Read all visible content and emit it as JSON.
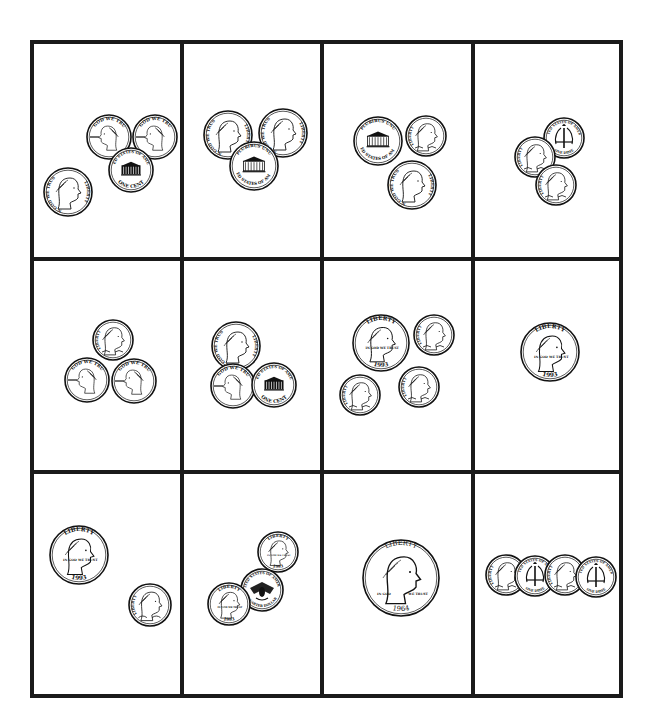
{
  "worksheet": {
    "title": "",
    "grid": {
      "rows": 3,
      "cols": 4,
      "border_color": "#1a1a1a",
      "left": 32,
      "top": 42,
      "right": 621,
      "bottom": 696,
      "v_lines": [
        182,
        322,
        473
      ],
      "h_lines": [
        259,
        472
      ],
      "line_width": 4
    },
    "cells": [
      {
        "id": 1,
        "coins": [
          {
            "type": "penny",
            "side": "front",
            "x": 109,
            "y": 137,
            "r": 22
          },
          {
            "type": "penny",
            "side": "front",
            "x": 155,
            "y": 137,
            "r": 22
          },
          {
            "type": "penny",
            "side": "back",
            "x": 131,
            "y": 170,
            "r": 22
          },
          {
            "type": "nickel",
            "side": "front",
            "x": 68,
            "y": 192,
            "r": 24
          }
        ]
      },
      {
        "id": 2,
        "coins": [
          {
            "type": "nickel",
            "side": "front",
            "x": 228,
            "y": 135,
            "r": 24
          },
          {
            "type": "nickel",
            "side": "front",
            "x": 283,
            "y": 133,
            "r": 24
          },
          {
            "type": "nickel",
            "side": "back",
            "x": 254,
            "y": 166,
            "r": 24
          }
        ]
      },
      {
        "id": 3,
        "coins": [
          {
            "type": "nickel",
            "side": "back",
            "x": 378,
            "y": 141,
            "r": 24
          },
          {
            "type": "dime",
            "side": "front",
            "x": 426,
            "y": 136,
            "r": 20
          },
          {
            "type": "nickel",
            "side": "front",
            "x": 412,
            "y": 185,
            "r": 24
          }
        ]
      },
      {
        "id": 4,
        "coins": [
          {
            "type": "dime",
            "side": "back",
            "x": 564,
            "y": 138,
            "r": 20
          },
          {
            "type": "dime",
            "side": "front",
            "x": 535,
            "y": 157,
            "r": 20
          },
          {
            "type": "dime",
            "side": "front",
            "x": 556,
            "y": 185,
            "r": 20
          }
        ]
      },
      {
        "id": 5,
        "coins": [
          {
            "type": "dime",
            "side": "front",
            "x": 113,
            "y": 340,
            "r": 20
          },
          {
            "type": "penny",
            "side": "front",
            "x": 87,
            "y": 380,
            "r": 22
          },
          {
            "type": "penny",
            "side": "front",
            "x": 134,
            "y": 381,
            "r": 22
          }
        ]
      },
      {
        "id": 6,
        "coins": [
          {
            "type": "nickel",
            "side": "front",
            "x": 236,
            "y": 346,
            "r": 24
          },
          {
            "type": "penny",
            "side": "front",
            "x": 233,
            "y": 386,
            "r": 22
          },
          {
            "type": "penny",
            "side": "back",
            "x": 274,
            "y": 385,
            "r": 22
          }
        ]
      },
      {
        "id": 7,
        "coins": [
          {
            "type": "quarter",
            "side": "front",
            "x": 381,
            "y": 343,
            "r": 28
          },
          {
            "type": "dime",
            "side": "front",
            "x": 434,
            "y": 335,
            "r": 20
          },
          {
            "type": "dime",
            "side": "front",
            "x": 360,
            "y": 395,
            "r": 20
          },
          {
            "type": "dime",
            "side": "front",
            "x": 419,
            "y": 387,
            "r": 20
          }
        ]
      },
      {
        "id": 8,
        "coins": [
          {
            "type": "quarter",
            "side": "front",
            "x": 550,
            "y": 352,
            "r": 29
          }
        ]
      },
      {
        "id": 9,
        "coins": [
          {
            "type": "quarter",
            "side": "front",
            "x": 79,
            "y": 555,
            "r": 29
          },
          {
            "type": "dime",
            "side": "front",
            "x": 150,
            "y": 605,
            "r": 21
          }
        ]
      },
      {
        "id": 10,
        "coins": [
          {
            "type": "quarter",
            "side": "front",
            "x": 278,
            "y": 552,
            "r": 20
          },
          {
            "type": "quarter",
            "side": "back",
            "x": 262,
            "y": 590,
            "r": 21
          },
          {
            "type": "quarter",
            "side": "front",
            "x": 229,
            "y": 604,
            "r": 21
          }
        ]
      },
      {
        "id": 11,
        "coins": [
          {
            "type": "half-dollar",
            "side": "front",
            "x": 401,
            "y": 578,
            "r": 38
          }
        ]
      },
      {
        "id": 12,
        "coins": [
          {
            "type": "dime",
            "side": "front",
            "x": 506,
            "y": 575,
            "r": 20
          },
          {
            "type": "dime",
            "side": "back",
            "x": 535,
            "y": 576,
            "r": 20
          },
          {
            "type": "dime",
            "side": "front",
            "x": 565,
            "y": 575,
            "r": 20
          },
          {
            "type": "dime",
            "side": "back",
            "x": 596,
            "y": 577,
            "r": 20
          }
        ]
      }
    ]
  },
  "coin_legends": {
    "penny_front_top": "IN GOD WE TRUST",
    "penny_front_left": "LIBERTY",
    "penny_back_bottom": "ONE CENT",
    "penny_back_top": "UNITED STATES OF AMERICA",
    "nickel_front_left": "IN GOD WE TRUST",
    "nickel_front_right": "LIBERTY",
    "nickel_back_top": "E PLURIBUS UNUM",
    "nickel_back_mid": "MONTICELLO",
    "nickel_back_low": "FIVE CENTS",
    "nickel_back_bottom": "UNITED STATES OF AMERICA",
    "dime_front_left": "LIBERTY",
    "dime_front_bottom": "IN GOD WE TRUST",
    "dime_back_top": "UNITED STATES OF AMERICA",
    "dime_back_bottom": "ONE DIME",
    "quarter_front_top": "LIBERTY",
    "quarter_front_left": "IN GOD WE TRUST",
    "quarter_front_year": "1993",
    "quarter_back_top": "UNITED STATES OF AMERICA",
    "quarter_back_bottom": "QUARTER DOLLAR",
    "half_front_ring": "LIBERTY",
    "half_front_left": "IN GOD",
    "half_front_right": "WE TRUST",
    "half_front_year": "1964"
  }
}
